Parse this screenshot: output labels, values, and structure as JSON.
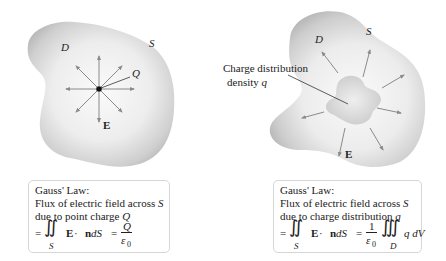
{
  "left_panel": {
    "labels": {
      "region": "D",
      "surface": "S",
      "charge": "Q",
      "field": "E"
    },
    "caption": {
      "title": "Gauss' Law:",
      "line1_prefix": "Flux of electric field across ",
      "line1_var": "S",
      "line2_prefix": "due to point charge ",
      "line2_var": "Q",
      "eq_equals": "=",
      "eq_integral": "∬",
      "eq_sub": "S",
      "eq_body_E": "E",
      "eq_body_dot": " · ",
      "eq_body_n": "n",
      "eq_body_dS": " dS",
      "eq_equals2": "=",
      "eq_num": "Q",
      "eq_den": "ε",
      "eq_den_sub": "0"
    }
  },
  "right_panel": {
    "labels": {
      "region": "D",
      "surface": "S",
      "field": "E",
      "callout_line1": "Charge distribution",
      "callout_line2_prefix": "density ",
      "callout_line2_var": "q"
    },
    "caption": {
      "title": "Gauss' Law:",
      "line1_prefix": "Flux of electric field across ",
      "line1_var": "S",
      "line2_prefix": "due to charge distribution ",
      "line2_var": "q",
      "eq_equals": "=",
      "eq_integral": "∬",
      "eq_sub": "S",
      "eq_body_E": "E",
      "eq_body_dot": " · ",
      "eq_body_n": "n",
      "eq_body_dS": " dS",
      "eq_equals2": "=",
      "eq_num": "1",
      "eq_den": "ε",
      "eq_den_sub": "0",
      "eq_triple": "∭",
      "eq_triple_sub": "D",
      "eq_tail": "q dV"
    }
  },
  "colors": {
    "blob_light": "#f4f4f4",
    "blob_dark": "#b8b8b8",
    "arrow": "#8a8a8a",
    "text": "#222222",
    "box_border": "#d6d6d6"
  }
}
